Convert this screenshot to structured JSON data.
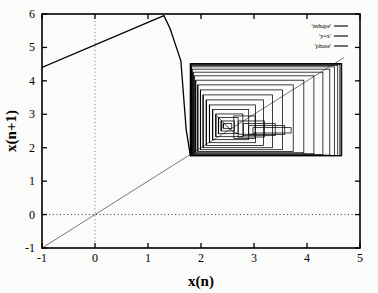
{
  "chart_data": {
    "type": "line",
    "title": "",
    "xlabel": "x(n)",
    "ylabel": "x(n+1)",
    "xlim": [
      -1,
      5
    ],
    "ylim": [
      -1,
      6
    ],
    "xticks": [
      "-1",
      "0",
      "1",
      "2",
      "3",
      "4",
      "5"
    ],
    "xtick_values": [
      -1,
      0,
      1,
      2,
      3,
      4,
      5
    ],
    "yticks": [
      "-1",
      "0",
      "1",
      "2",
      "3",
      "4",
      "5",
      "6"
    ],
    "ytick_values": [
      -1,
      0,
      1,
      2,
      3,
      4,
      5,
      6
    ],
    "grid": "dotted zero lines only",
    "legend_position": "top-right inside",
    "legend": [
      {
        "label": "'nshape'",
        "style": "solid",
        "color": "#000000"
      },
      {
        "label": "'y=x'",
        "style": "solid",
        "color": "#000000"
      },
      {
        "label": "'phase'",
        "style": "solid",
        "color": "#000000"
      }
    ],
    "series": [
      {
        "name": "'nshape'",
        "color": "#000000",
        "width": 1.3,
        "points": [
          [
            -1.0,
            4.4
          ],
          [
            1.3,
            5.95
          ],
          [
            1.42,
            5.55
          ],
          [
            1.62,
            4.6
          ],
          [
            1.72,
            2.55
          ],
          [
            1.8,
            1.75
          ]
        ]
      },
      {
        "name": "'y=x'",
        "color": "#555555",
        "width": 0.8,
        "points": [
          [
            -1.0,
            -1.0
          ],
          [
            4.7,
            4.7
          ]
        ]
      },
      {
        "name": "'phase'",
        "color": "#000000",
        "width": 0.75,
        "comment": "Outward-spiralling cobweb rectangles of the iterated map; each entry is one closed rectangular loop [x_left, x_right, y_bottom, y_top]",
        "rects": [
          [
            2.42,
            2.58,
            2.58,
            2.72
          ],
          [
            2.38,
            2.63,
            2.5,
            2.8
          ],
          [
            2.33,
            2.7,
            2.42,
            2.9
          ],
          [
            2.28,
            2.79,
            2.33,
            3.01
          ],
          [
            2.22,
            2.9,
            2.24,
            3.14
          ],
          [
            2.16,
            3.03,
            2.15,
            3.28
          ],
          [
            2.1,
            3.18,
            2.07,
            3.43
          ],
          [
            2.04,
            3.35,
            2.0,
            3.58
          ],
          [
            1.99,
            3.54,
            1.94,
            3.73
          ],
          [
            1.94,
            3.74,
            1.89,
            3.88
          ],
          [
            1.9,
            3.94,
            1.85,
            4.02
          ],
          [
            1.87,
            4.13,
            1.82,
            4.15
          ],
          [
            1.85,
            4.3,
            1.8,
            4.26
          ],
          [
            1.83,
            4.43,
            1.78,
            4.35
          ],
          [
            1.82,
            4.52,
            1.77,
            4.42
          ],
          [
            1.81,
            4.58,
            1.765,
            4.46
          ],
          [
            1.805,
            4.62,
            1.762,
            4.49
          ],
          [
            1.802,
            4.64,
            1.76,
            4.505
          ],
          [
            1.801,
            4.652,
            1.759,
            4.515
          ],
          [
            1.8,
            4.658,
            1.758,
            4.52
          ]
        ],
        "inner_funnel": [
          [
            2.3,
            2.95
          ],
          [
            2.5,
            2.62
          ],
          [
            2.63,
            2.45
          ],
          [
            2.74,
            2.4
          ],
          [
            2.9,
            2.4
          ],
          [
            3.05,
            2.42
          ]
        ],
        "lower_blocks": [
          [
            2.62,
            3.02,
            2.28,
            2.95
          ],
          [
            2.7,
            3.2,
            2.32,
            2.8
          ],
          [
            2.8,
            3.4,
            2.36,
            2.72
          ],
          [
            2.9,
            3.58,
            2.4,
            2.66
          ],
          [
            2.98,
            3.7,
            2.44,
            2.6
          ]
        ]
      }
    ]
  },
  "plot": {
    "frame": {
      "left": 42,
      "top": 14,
      "right": 360,
      "bottom": 248
    },
    "axis_color": "#000000",
    "frame_width": 1.6,
    "background": "#fbfbfa"
  }
}
